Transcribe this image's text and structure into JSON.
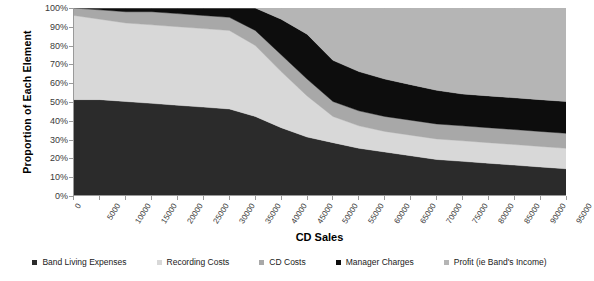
{
  "chart_data": {
    "type": "area",
    "title": "",
    "xlabel": "CD Sales",
    "ylabel": "Proportion of Each Element",
    "stacked": true,
    "normalized_percent": true,
    "grid": false,
    "legend_position": "bottom",
    "xlim": [
      0,
      95000
    ],
    "ylim": [
      0,
      100
    ],
    "x_tick_labels": [
      "0",
      "5000",
      "10000",
      "15000",
      "20000",
      "25000",
      "30000",
      "35000",
      "40000",
      "45000",
      "50000",
      "55000",
      "60000",
      "65000",
      "70000",
      "75000",
      "80000",
      "85000",
      "90000",
      "95000"
    ],
    "y_tick_labels": [
      "0%",
      "10%",
      "20%",
      "30%",
      "40%",
      "50%",
      "60%",
      "70%",
      "80%",
      "90%",
      "100%"
    ],
    "y_tick_values": [
      0,
      10,
      20,
      30,
      40,
      50,
      60,
      70,
      80,
      90,
      100
    ],
    "x": [
      0,
      5000,
      10000,
      15000,
      20000,
      25000,
      30000,
      35000,
      40000,
      45000,
      50000,
      55000,
      60000,
      65000,
      70000,
      75000,
      80000,
      85000,
      90000,
      95000
    ],
    "series": [
      {
        "name": "Band Living Expenses",
        "color": "#2b2b2b",
        "values": [
          51,
          51,
          50,
          49,
          48,
          47,
          46,
          42,
          36,
          31,
          28,
          25,
          23,
          21,
          19,
          18,
          17,
          16,
          15,
          14
        ]
      },
      {
        "name": "Recording Costs",
        "color": "#d8d8d8",
        "values": [
          45,
          43,
          42,
          42,
          42,
          42,
          42,
          38,
          30,
          22,
          14,
          12,
          11,
          11,
          11,
          11,
          11,
          11,
          11,
          11
        ]
      },
      {
        "name": "CD Costs",
        "color": "#a8a8a8",
        "values": [
          4,
          5,
          6,
          7,
          7,
          7,
          7,
          8,
          9,
          9,
          8,
          8,
          8,
          8,
          8,
          8,
          8,
          8,
          8,
          8
        ]
      },
      {
        "name": "Manager Charges",
        "color": "#0d0d0d",
        "values": [
          0,
          1,
          2,
          2,
          3,
          4,
          5,
          12,
          19,
          24,
          22,
          21,
          20,
          19,
          18,
          17,
          17,
          17,
          17,
          17
        ]
      },
      {
        "name": "Profit (ie Band's Income)",
        "color": "#b5b5b5",
        "values": [
          0,
          0,
          0,
          0,
          0,
          0,
          0,
          0,
          6,
          14,
          28,
          34,
          38,
          41,
          44,
          46,
          47,
          48,
          49,
          50
        ]
      }
    ]
  },
  "axes": {
    "y_title": "Proportion of Each Element",
    "x_title": "CD Sales"
  },
  "legend": {
    "items": [
      {
        "label": "Band Living Expenses",
        "color": "#2b2b2b"
      },
      {
        "label": "Recording Costs",
        "color": "#d8d8d8"
      },
      {
        "label": "CD Costs",
        "color": "#a8a8a8"
      },
      {
        "label": "Manager Charges",
        "color": "#0d0d0d"
      },
      {
        "label": "Profit (ie Band's Income)",
        "color": "#b5b5b5"
      }
    ]
  }
}
